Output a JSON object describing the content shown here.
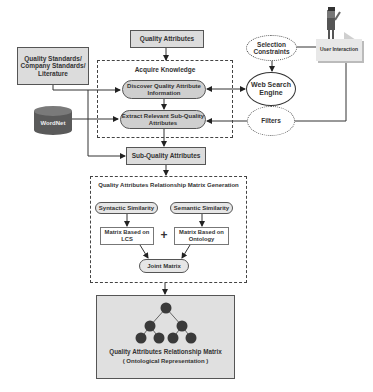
{
  "nodes": {
    "quality_attributes": "Quality Attributes",
    "quality_standards": "Quality Standards/ Company Standards/ Literature",
    "acquire_knowledge": "Acquire Knowledge",
    "discover": "Discover Quality Attribute Information",
    "extract": "Extract Relevant Sub-Quality Attributes",
    "wordnet": "WordNet",
    "selection_constraints": "Selection Constraints",
    "web_search_engine": "Web Search Engine",
    "filters": "Filters",
    "user_interaction": "User Interaction",
    "sub_quality_attributes": "Sub-Quality Attributes",
    "matrix_generation": "Quality Attributes Relationship Matrix Generation",
    "syntactic_similarity": "Syntactic Similarity",
    "semantic_similarity": "Semantic Similarity",
    "matrix_lcs": "Matrix Based on LCS",
    "matrix_ontology": "Matrix Based on Ontology",
    "plus": "+",
    "joint_matrix": "Joint Matrix",
    "output_title": "Quality Attributes Relationship Matrix",
    "output_subtitle": "( Ontological Representation )"
  },
  "colors": {
    "box_fill": "#dcdcdc",
    "pill_fill": "#cfcfcf",
    "node_dark": "#3a3a3a",
    "wordnet": "#5a5a5a",
    "output_fill": "#e0e0e0"
  }
}
